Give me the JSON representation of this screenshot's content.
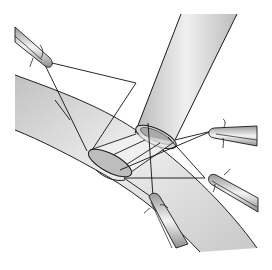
{
  "figure": {
    "type": "medical-illustration",
    "colors": {
      "background": "#ffffff",
      "vessel_fill_light": "#f2f2f2",
      "vessel_fill_dark": "#bdbdbd",
      "outline": "#1a1a1a",
      "suture": "#111111"
    },
    "components": [
      {
        "name": "host-vessel",
        "label": "recipient vessel"
      },
      {
        "name": "graft-vessel",
        "label": "graft vessel"
      },
      {
        "name": "anastomosis-opening",
        "label": "arteriotomy"
      },
      {
        "name": "stay-sutures",
        "label": "sutures"
      },
      {
        "name": "clamp-top-left",
        "label": "clamp"
      },
      {
        "name": "clamp-right-upper",
        "label": "clamp"
      },
      {
        "name": "clamp-right-lower",
        "label": "clamp"
      },
      {
        "name": "clamp-bottom",
        "label": "clamp"
      }
    ]
  }
}
